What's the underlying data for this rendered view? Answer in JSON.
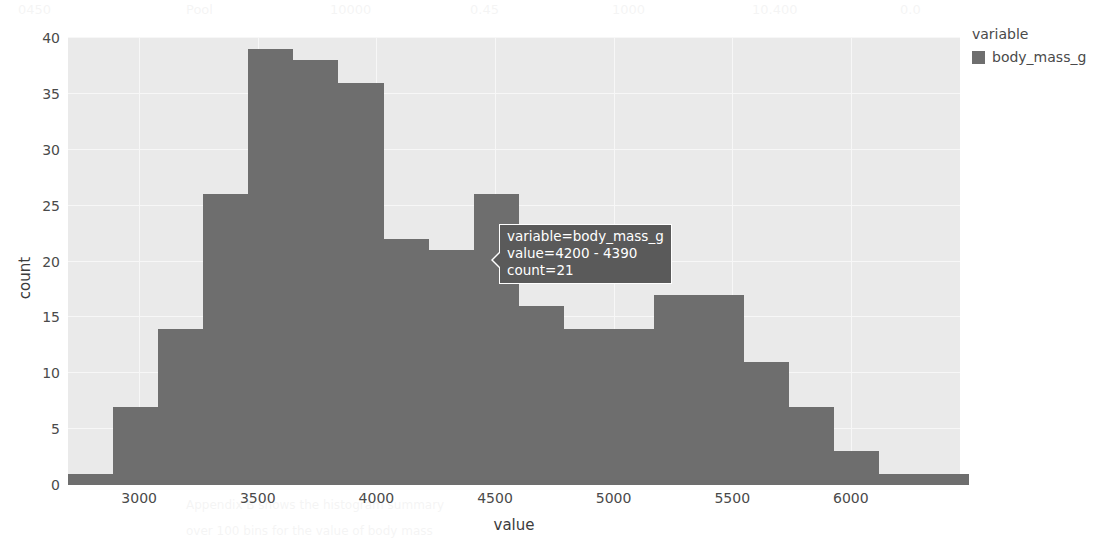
{
  "chart_data": {
    "type": "bar",
    "title": "",
    "xlabel": "value",
    "ylabel": "count",
    "xlim": [
      2700,
      6460
    ],
    "ylim": [
      0,
      40
    ],
    "grid": true,
    "bin_width": 190,
    "categories": [
      "2700 - 2890",
      "2890 - 3080",
      "3080 - 3270",
      "3270 - 3460",
      "3460 - 3650",
      "3650 - 3840",
      "3840 - 4030",
      "4030 - 4220",
      "4200 - 4390",
      "4390 - 4580",
      "4580 - 4770",
      "4770 - 4960",
      "4960 - 5150",
      "5150 - 5340",
      "5340 - 5530",
      "5530 - 5720",
      "5720 - 5910",
      "5910 - 6100",
      "6100 - 6290",
      "6290 - 6480"
    ],
    "bin_starts": [
      2700,
      2890,
      3080,
      3270,
      3460,
      3650,
      3840,
      4030,
      4220,
      4410,
      4600,
      4790,
      4980,
      5170,
      5360,
      5550,
      5740,
      5930,
      6120,
      6310
    ],
    "values": [
      1,
      7,
      14,
      26,
      39,
      38,
      36,
      22,
      21,
      26,
      16,
      14,
      14,
      17,
      17,
      11,
      7,
      3,
      1,
      1
    ],
    "series": [
      {
        "name": "body_mass_g",
        "color": "#6e6e6e"
      }
    ],
    "xticks": [
      3000,
      3500,
      4000,
      4500,
      5000,
      5500,
      6000
    ],
    "xtick_labels": [
      "3000",
      "3500",
      "4000",
      "4500",
      "5000",
      "5500",
      "6000"
    ],
    "yticks": [
      0,
      5,
      10,
      15,
      20,
      25,
      30,
      35,
      40
    ],
    "ytick_labels": [
      "0",
      "5",
      "10",
      "15",
      "20",
      "25",
      "30",
      "35",
      "40"
    ],
    "legend_position": "right",
    "panel_color": "#eaeaea",
    "grid_color": "#f7f7f7",
    "bar_color": "#6e6e6e"
  },
  "legend": {
    "title": "variable",
    "entries": [
      {
        "label": "body_mass_g",
        "color": "#6e6e6e"
      }
    ]
  },
  "tooltip": {
    "lines": [
      "variable=body_mass_g",
      "value=4200 - 4390",
      "count=21"
    ],
    "variable": "body_mass_g",
    "value": "4200 - 4390",
    "count": "21",
    "background": "#5a5a5a",
    "text_color": "#ffffff"
  },
  "background_bleed": [
    {
      "x": 18,
      "y": 2,
      "t": "0450",
      "s": 13
    },
    {
      "x": 186,
      "y": 2,
      "t": "Pool",
      "s": 13
    },
    {
      "x": 330,
      "y": 2,
      "t": "10000",
      "s": 13
    },
    {
      "x": 470,
      "y": 2,
      "t": "0.45",
      "s": 13
    },
    {
      "x": 612,
      "y": 2,
      "t": "1000",
      "s": 13
    },
    {
      "x": 752,
      "y": 2,
      "t": "10.400",
      "s": 13
    },
    {
      "x": 900,
      "y": 2,
      "t": "0.0",
      "s": 13
    },
    {
      "x": 60,
      "y": 44,
      "t": "",
      "s": 12
    },
    {
      "x": 628,
      "y": 56,
      "t": "Figure 2",
      "s": 12
    },
    {
      "x": 192,
      "y": 132,
      "t": "",
      "s": 12
    },
    {
      "x": 420,
      "y": 128,
      "t": "",
      "s": 12
    },
    {
      "x": 660,
      "y": 132,
      "t": "",
      "s": 12
    },
    {
      "x": 186,
      "y": 182,
      "t": "We were standing on the corner of the",
      "s": 12
    },
    {
      "x": 640,
      "y": 182,
      "t": "and the mass",
      "s": 12
    },
    {
      "x": 186,
      "y": 206,
      "t": "of the penguin data that was collected",
      "s": 12
    },
    {
      "x": 640,
      "y": 206,
      "t": "in the study",
      "s": 12
    },
    {
      "x": 186,
      "y": 232,
      "t": "distributions and the count of each",
      "s": 12
    },
    {
      "x": 640,
      "y": 232,
      "t": "",
      "s": 12
    },
    {
      "x": 90,
      "y": 300,
      "t": "",
      "s": 12
    },
    {
      "x": 700,
      "y": 290,
      "t": "",
      "s": 12
    },
    {
      "x": 186,
      "y": 498,
      "t": "Appendix B shows the histogram summary",
      "s": 12
    },
    {
      "x": 186,
      "y": 524,
      "t": "over 100 bins for the value of body mass",
      "s": 12
    },
    {
      "x": 186,
      "y": 548,
      "t": "",
      "s": 12
    }
  ]
}
